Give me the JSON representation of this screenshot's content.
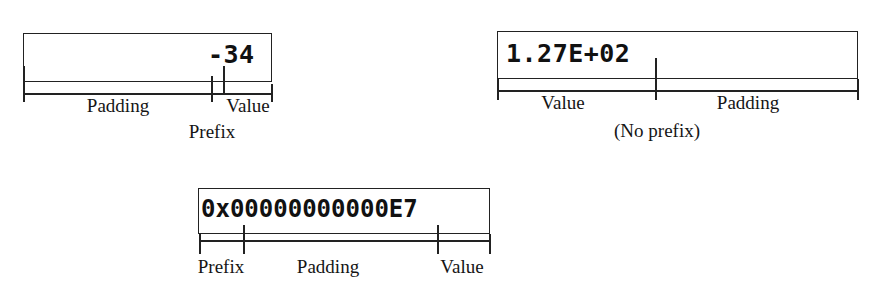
{
  "figure": {
    "kind": "formatted-field-anatomy-diagram",
    "background_color": "#ffffff",
    "line_color": "#222222",
    "text_color": "#151515"
  },
  "diagrams": [
    {
      "id": "negative-decimal",
      "field_text": "-34",
      "alignment": "right",
      "segments": [
        {
          "name": "padding",
          "label": "Padding"
        },
        {
          "name": "prefix",
          "label": "Prefix"
        },
        {
          "name": "value",
          "label": "Value"
        }
      ]
    },
    {
      "id": "scientific-notation",
      "field_text": "1.27E+02",
      "alignment": "left",
      "note": "(No prefix)",
      "segments": [
        {
          "name": "value",
          "label": "Value"
        },
        {
          "name": "padding",
          "label": "Padding"
        }
      ]
    },
    {
      "id": "hexadecimal-zero-padded",
      "field_text": "0x00000000000E7",
      "alignment": "left",
      "segments": [
        {
          "name": "prefix",
          "label": "Prefix"
        },
        {
          "name": "padding",
          "label": "Padding"
        },
        {
          "name": "value",
          "label": "Value"
        }
      ]
    }
  ]
}
